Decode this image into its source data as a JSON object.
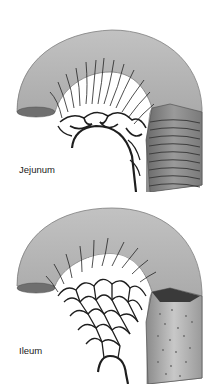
{
  "figure": {
    "panels": [
      {
        "id": "jejunum",
        "label": "Jejunum",
        "features": {
          "vasa_recta": "long",
          "arterial_arcades": "few, large loops",
          "mucosal_folds": "prominent circular folds (plicae circulares)"
        }
      },
      {
        "id": "ileum",
        "label": "Ileum",
        "features": {
          "vasa_recta": "short",
          "arterial_arcades": "many, complex loops",
          "mucosal_folds": "sparse, with lymphoid nodules"
        }
      }
    ],
    "colors": {
      "tube_fill": "#a9a9a9",
      "tube_shadow": "#7a7a7a",
      "vessel": "#1e1e1e",
      "background": "#ffffff"
    }
  }
}
